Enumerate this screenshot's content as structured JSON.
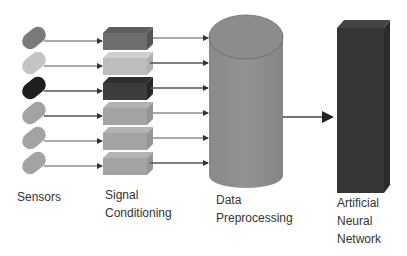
{
  "diagram": {
    "type": "pipeline",
    "stages": [
      {
        "id": "sensors",
        "label_lines": [
          "Sensors"
        ]
      },
      {
        "id": "signal_conditioning",
        "label_lines": [
          "Signal",
          "Conditioning"
        ]
      },
      {
        "id": "data_preprocessing",
        "label_lines": [
          "Data",
          "Preprocessing"
        ]
      },
      {
        "id": "ann",
        "label_lines": [
          "Artificial",
          "Neural",
          "Network"
        ]
      }
    ],
    "channels": [
      {
        "index": 0,
        "sensor_color": "#7a7a7a",
        "box_color": "#6e6e6e"
      },
      {
        "index": 1,
        "sensor_color": "#c4c4c4",
        "box_color": "#bdbdbd"
      },
      {
        "index": 2,
        "sensor_color": "#1e1e1e",
        "box_color": "#3c3c3c"
      },
      {
        "index": 3,
        "sensor_color": "#a3a3a3",
        "box_color": "#a3a3a3"
      },
      {
        "index": 4,
        "sensor_color": "#a3a3a3",
        "box_color": "#a3a3a3"
      },
      {
        "index": 5,
        "sensor_color": "#a3a3a3",
        "box_color": "#a3a3a3"
      }
    ],
    "edges": [
      {
        "from": "sensors",
        "to": "signal_conditioning",
        "count": 6
      },
      {
        "from": "signal_conditioning",
        "to": "data_preprocessing",
        "count": 6
      },
      {
        "from": "data_preprocessing",
        "to": "ann",
        "count": 1
      }
    ],
    "colors": {
      "cylinder": "#8e8e8e",
      "ann_box": "#333333",
      "arrow": "#333333"
    }
  }
}
